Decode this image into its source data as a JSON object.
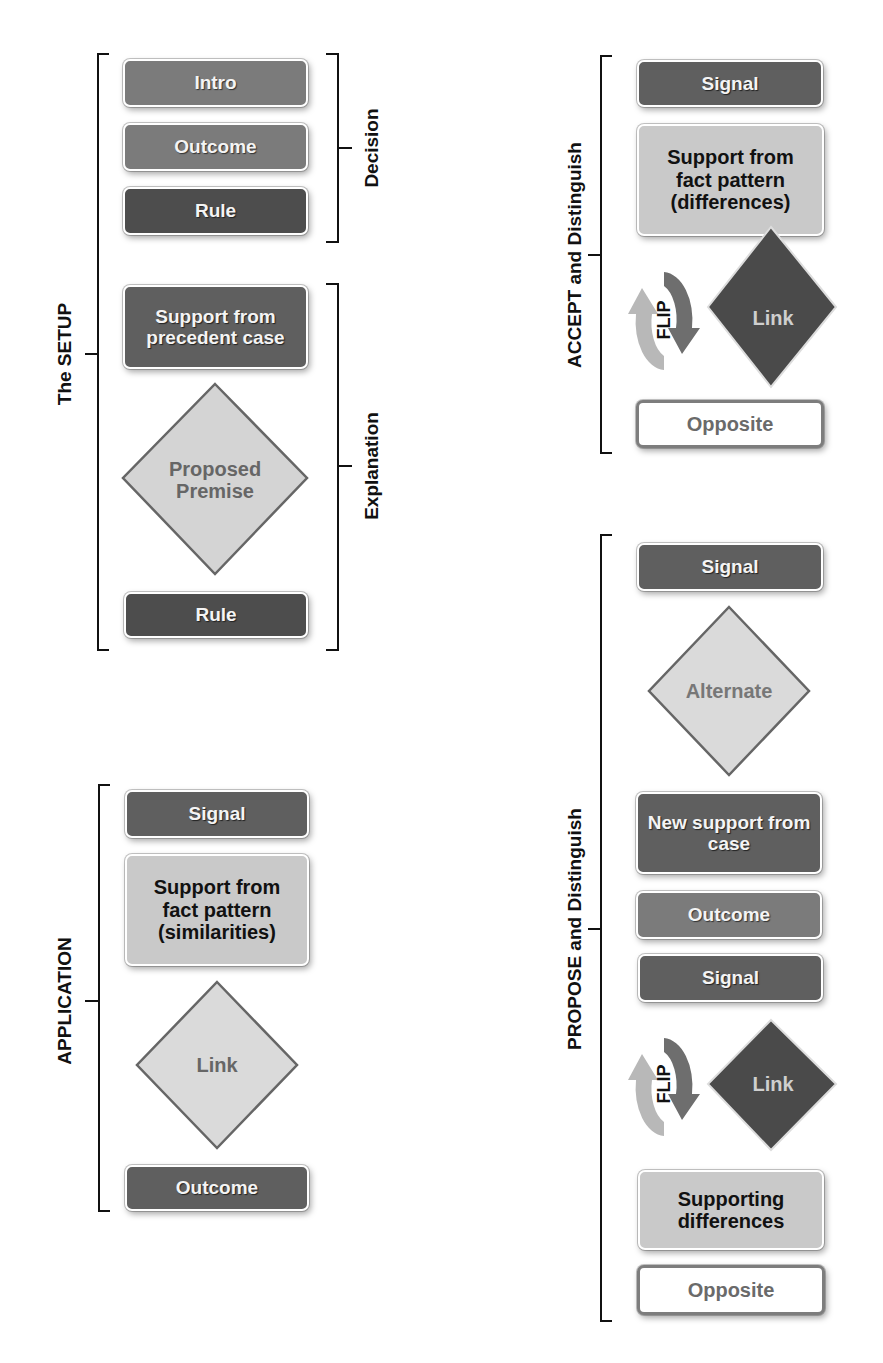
{
  "diagram": {
    "sections": {
      "setup": {
        "label": "The SETUP",
        "subgroups": {
          "decision": {
            "label": "Decision"
          },
          "explanation": {
            "label": "Explanation"
          }
        },
        "items": [
          {
            "label": "Intro",
            "shape": "box",
            "tone": "medium"
          },
          {
            "label": "Outcome",
            "shape": "box",
            "tone": "medium"
          },
          {
            "label": "Rule",
            "shape": "box",
            "tone": "dark"
          },
          {
            "label": "Support from precedent case",
            "shape": "box",
            "tone": "dark-medium"
          },
          {
            "label": "Proposed Premise",
            "shape": "diamond",
            "tone": "light"
          },
          {
            "label": "Rule",
            "shape": "box",
            "tone": "dark"
          }
        ]
      },
      "application": {
        "label": "APPLICATION",
        "items": [
          {
            "label": "Signal",
            "shape": "box",
            "tone": "dark-medium"
          },
          {
            "label": "Support from fact pattern (similarities)",
            "shape": "box",
            "tone": "light"
          },
          {
            "label": "Link",
            "shape": "diamond",
            "tone": "light"
          },
          {
            "label": "Outcome",
            "shape": "box",
            "tone": "dark-medium"
          }
        ]
      },
      "accept": {
        "label": "ACCEPT and Distinguish",
        "items": [
          {
            "label": "Signal",
            "shape": "box",
            "tone": "dark-medium"
          },
          {
            "label": "Support from fact pattern (differences)",
            "shape": "box",
            "tone": "light"
          },
          {
            "label": "FLIP",
            "shape": "circular-arrow"
          },
          {
            "label": "Link",
            "shape": "diamond",
            "tone": "dark"
          },
          {
            "label": "Opposite",
            "shape": "box",
            "tone": "outline"
          }
        ]
      },
      "propose": {
        "label": "PROPOSE and Distinguish",
        "items": [
          {
            "label": "Signal",
            "shape": "box",
            "tone": "dark-medium"
          },
          {
            "label": "Alternate",
            "shape": "diamond",
            "tone": "light"
          },
          {
            "label": "New support from case",
            "shape": "box",
            "tone": "dark-medium"
          },
          {
            "label": "Outcome",
            "shape": "box",
            "tone": "medium"
          },
          {
            "label": "Signal",
            "shape": "box",
            "tone": "dark-medium"
          },
          {
            "label": "FLIP",
            "shape": "circular-arrow"
          },
          {
            "label": "Link",
            "shape": "diamond",
            "tone": "dark"
          },
          {
            "label": "Supporting differences",
            "shape": "box",
            "tone": "light"
          },
          {
            "label": "Opposite",
            "shape": "box",
            "tone": "outline"
          }
        ]
      }
    },
    "colors": {
      "medium": "#7b7b7b",
      "dark_medium": "#5f5f5f",
      "dark": "#4d4d4d",
      "light": "#c9c9c9",
      "outline_border": "#7d7d7d",
      "bracket": "#111111"
    }
  }
}
